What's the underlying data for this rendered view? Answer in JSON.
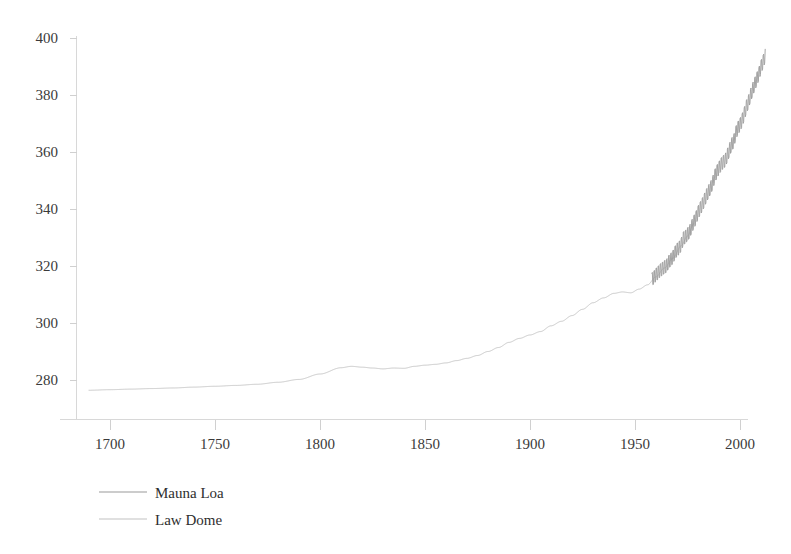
{
  "chart_data": {
    "type": "line",
    "title": "",
    "subtitle": "",
    "xlabel": "",
    "ylabel": "",
    "xlim": [
      1688,
      2016
    ],
    "ylim": [
      272,
      404
    ],
    "grid": false,
    "legend_position": "bottom-left",
    "x_ticks": [
      1700,
      1750,
      1800,
      1850,
      1900,
      1950,
      2000
    ],
    "y_ticks": [
      280,
      300,
      320,
      340,
      360,
      380,
      400
    ],
    "x_tick_labels": [
      "1700",
      "1750",
      "1800",
      "1850",
      "1900",
      "1950",
      "2000"
    ],
    "y_tick_labels": [
      "280",
      "300",
      "320",
      "340",
      "360",
      "380",
      "400"
    ],
    "series": [
      {
        "name": "Mauna Loa",
        "color": "#9a9a9a",
        "line_width": 0.9,
        "x_start": 1958,
        "x_end": 2012,
        "seasonal_amplitude": 3.2,
        "x": [
          1958,
          1959,
          1960,
          1961,
          1962,
          1963,
          1964,
          1965,
          1966,
          1967,
          1968,
          1969,
          1970,
          1971,
          1972,
          1973,
          1974,
          1975,
          1976,
          1977,
          1978,
          1979,
          1980,
          1981,
          1982,
          1983,
          1984,
          1985,
          1986,
          1987,
          1988,
          1989,
          1990,
          1991,
          1992,
          1993,
          1994,
          1995,
          1996,
          1997,
          1998,
          1999,
          2000,
          2001,
          2002,
          2003,
          2004,
          2005,
          2006,
          2007,
          2008,
          2009,
          2010,
          2011,
          2012
        ],
        "values": [
          315.3,
          315.98,
          316.91,
          317.64,
          318.45,
          318.99,
          319.62,
          320.04,
          321.38,
          322.16,
          323.04,
          324.62,
          325.68,
          326.32,
          327.45,
          329.68,
          330.18,
          331.11,
          332.04,
          333.83,
          335.4,
          336.84,
          338.75,
          340.11,
          341.45,
          343.05,
          344.65,
          346.12,
          347.42,
          349.19,
          351.57,
          353.12,
          354.39,
          355.61,
          356.45,
          357.1,
          358.83,
          360.82,
          362.61,
          363.73,
          366.7,
          368.38,
          369.55,
          371.14,
          373.28,
          375.8,
          377.52,
          379.8,
          381.9,
          383.79,
          385.6,
          387.43,
          389.9,
          391.65,
          393.85
        ]
      },
      {
        "name": "Law Dome",
        "color": "#c2c2c2",
        "line_width": 0.9,
        "x_start": 1690,
        "x_end": 1978,
        "seasonal_amplitude": 0,
        "x": [
          1690,
          1700,
          1710,
          1720,
          1730,
          1740,
          1750,
          1760,
          1770,
          1780,
          1790,
          1800,
          1810,
          1815,
          1820,
          1825,
          1830,
          1835,
          1840,
          1845,
          1850,
          1855,
          1860,
          1865,
          1870,
          1875,
          1880,
          1885,
          1890,
          1895,
          1900,
          1905,
          1910,
          1915,
          1920,
          1925,
          1930,
          1935,
          1940,
          1944,
          1948,
          1952,
          1956,
          1960,
          1964,
          1968,
          1972,
          1975,
          1978
        ],
        "values": [
          276.4,
          276.6,
          276.8,
          277.0,
          277.2,
          277.5,
          277.8,
          278.1,
          278.5,
          279.2,
          280.2,
          282.1,
          284.3,
          284.8,
          284.5,
          284.2,
          283.9,
          284.2,
          284.1,
          284.8,
          285.2,
          285.5,
          286.0,
          286.8,
          287.6,
          288.6,
          290.0,
          291.4,
          293.2,
          294.6,
          295.8,
          297.0,
          299.0,
          300.6,
          302.6,
          304.8,
          307.1,
          308.8,
          310.4,
          310.9,
          310.6,
          311.9,
          313.4,
          316.2,
          319.3,
          322.7,
          327.1,
          330.5,
          334.8
        ]
      }
    ]
  },
  "legend": {
    "entries": [
      {
        "label": "Mauna Loa",
        "color": "#9a9a9a"
      },
      {
        "label": "Law Dome",
        "color": "#c2c2c2"
      }
    ]
  },
  "colors": {
    "background": "#ffffff",
    "axis": "#d8d8d8",
    "tick": "#d0d0d0",
    "tick_text": "#3a3a3a",
    "legend_text": "#2e2e2e",
    "mauna_loa": "#9a9a9a",
    "law_dome": "#c2c2c2"
  }
}
